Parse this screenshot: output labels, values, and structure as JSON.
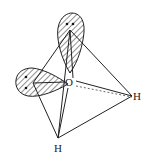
{
  "diagram": {
    "atoms": [
      {
        "id": "O",
        "label": "O",
        "x": 69,
        "y": 82
      },
      {
        "id": "H1",
        "label": "H",
        "x": 138,
        "y": 97
      },
      {
        "id": "H2",
        "label": "H",
        "x": 58,
        "y": 149
      }
    ],
    "lone_pair_lobes": [
      {
        "id": "top",
        "apex": [
          70,
          30
        ],
        "electrons": 2
      },
      {
        "id": "left",
        "apex": [
          33,
          83
        ],
        "electrons": 2
      }
    ],
    "colors": {
      "line": "#222222",
      "background": "#ffffff"
    }
  }
}
